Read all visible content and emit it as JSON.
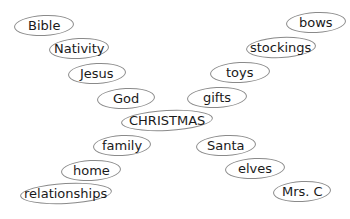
{
  "diagram": {
    "center": {
      "label": "CHRISTMAS"
    },
    "left_branch_upper": [
      {
        "label": "Bible"
      },
      {
        "label": "Nativity"
      },
      {
        "label": "Jesus"
      },
      {
        "label": "God"
      }
    ],
    "left_branch_lower": [
      {
        "label": "family"
      },
      {
        "label": "home"
      },
      {
        "label": "relationships"
      }
    ],
    "right_branch_upper": [
      {
        "label": "bows"
      },
      {
        "label": "stockings"
      },
      {
        "label": "toys"
      },
      {
        "label": "gifts"
      }
    ],
    "right_branch_lower": [
      {
        "label": "Santa"
      },
      {
        "label": "elves"
      },
      {
        "label": "Mrs. C"
      }
    ]
  }
}
